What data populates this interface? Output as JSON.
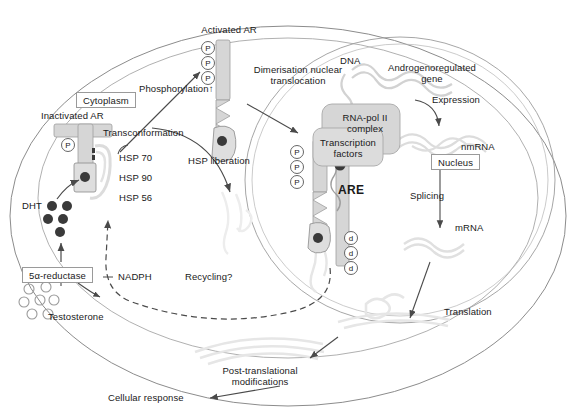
{
  "figure": {
    "type": "biological-pathway-diagram"
  },
  "compartments": {
    "cytoplasm_label": "Cytoplasm",
    "nucleus_label": "Nucleus"
  },
  "labels": {
    "activated_ar": "Activated AR",
    "inactivated_ar": "Inactivated AR",
    "phosphorylation": "Phosphorylation",
    "phosphorylation_arrow": "↑",
    "transconformation": "Transconformation",
    "hsp_liberation": "HSP liberation",
    "dimerisation_line1": "Dimerisation nuclear",
    "dimerisation_line2": "translocation",
    "dna": "DNA",
    "androgen_gene_line1": "Androgenoregulated",
    "androgen_gene_line2": "gene",
    "expression": "Expression",
    "rnapol_line1": "RNA-pol II",
    "rnapol_line2": "complex",
    "transcription_line1": "Transcription",
    "transcription_line2": "factors",
    "are": "ARE",
    "nmrna": "nmRNA",
    "splicing": "Splicing",
    "mrna": "mRNA",
    "translation": "Translation",
    "post_translational_line1": "Post-translational",
    "post_translational_line2": "modifications",
    "cellular_response": "Cellular response",
    "recycling": "Recycling?",
    "nadph": "NADPH",
    "reductase": "5α-reductase",
    "testosterone": "Testosterone",
    "dht": "DHT",
    "hsp70": "HSP 70",
    "hsp90": "HSP 90",
    "hsp56": "HSP 56"
  },
  "badges": {
    "phosphate": "P",
    "dimer_mark": "d"
  },
  "counts": {
    "activated_ar_phosphates": 3,
    "nuclear_ar_phosphates": 3,
    "dimer_marks": 3,
    "dht_molecules": 5,
    "testosterone_molecules": 7,
    "inactivated_ar_phosphates": 1
  },
  "colors": {
    "outline": "#8c8c8c",
    "protein_fill": "#d6d6d6",
    "protein_stroke": "#9e9e9e",
    "ligand_fill": "#3a3a3a",
    "arrow": "#4a4a4a",
    "faint": "#ececec",
    "text": "#1a1a1a"
  }
}
